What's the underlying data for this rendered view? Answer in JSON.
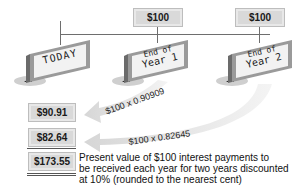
{
  "timeline": {
    "signs": [
      {
        "id": "today",
        "lines": [
          "TODAY"
        ]
      },
      {
        "id": "year1",
        "lines": [
          "End of",
          "Year 1"
        ]
      },
      {
        "id": "year2",
        "lines": [
          "End of",
          "Year 2"
        ]
      }
    ],
    "payments": [
      {
        "label": "$100",
        "year": 1
      },
      {
        "label": "$100",
        "year": 2
      }
    ]
  },
  "arrows": [
    {
      "label": "$100 x 0.90909",
      "from": "year1"
    },
    {
      "label": "$100 x 0.82645",
      "from": "year2"
    }
  ],
  "present_values": [
    {
      "label": "$90.91"
    },
    {
      "label": "$82.64"
    }
  ],
  "total": {
    "label": "$173.55",
    "description": "Present value of $100 interest payments to be received each year for two years discounted at 10% (rounded to the nearest cent)",
    "desc_lines": [
      "Present value of $100 interest payments to",
      "be received each year for two years discounted",
      "at 10% (rounded to the nearest cent)"
    ]
  },
  "colors": {
    "line": "#6e6e6e",
    "money_bg": "#d9d9d9",
    "arrow": "#e2e2e2",
    "sign_face": "#f2f2f2",
    "sign_frame": "#9a9a9a"
  }
}
